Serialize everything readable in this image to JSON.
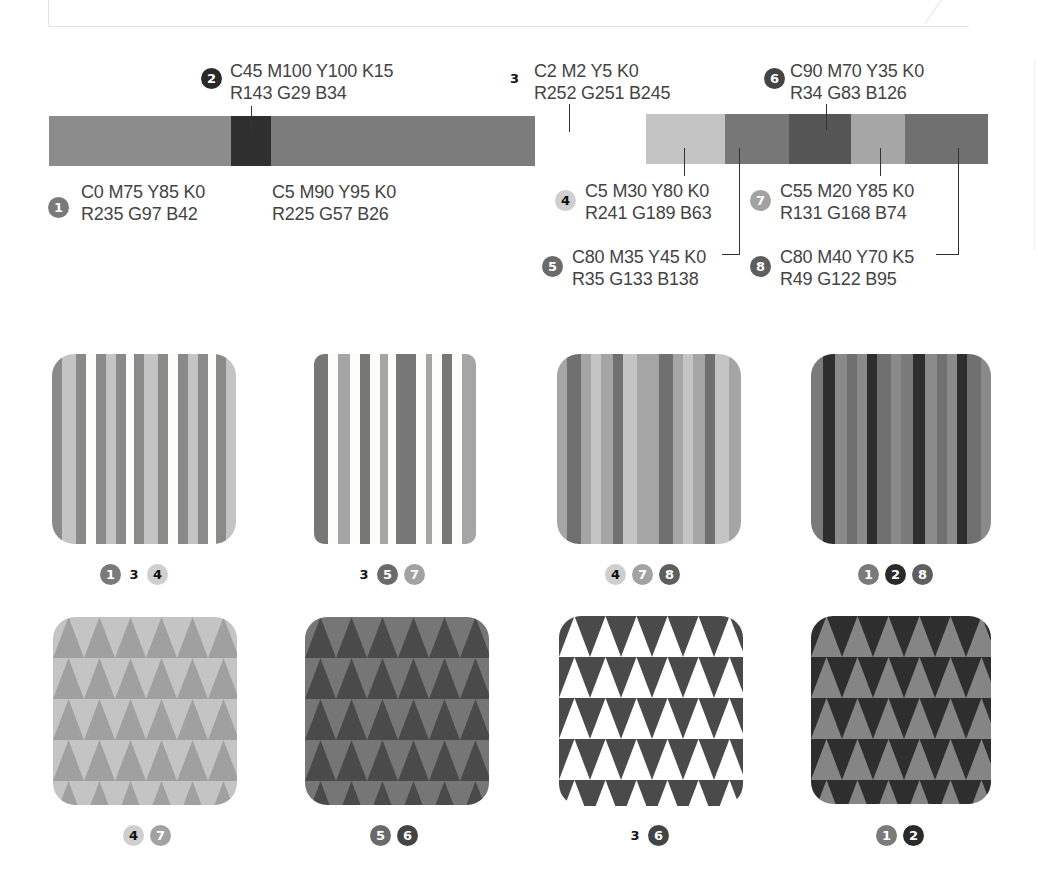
{
  "colors": [
    {
      "id": "1",
      "cmyk": "C0 M75 Y85 K0",
      "rgb": "R235 G97 B42",
      "gray": "#8a8a8a",
      "text_dark": false
    },
    {
      "id": "2",
      "cmyk": "C45 M100 Y100 K15",
      "rgb": "R143 G29 B34",
      "gray": "#2e2e2e",
      "text_dark": false
    },
    {
      "id": "3",
      "cmyk": "C2 M2 Y5 K0",
      "rgb": "R252 G251 B245",
      "gray": "#fcfcfa",
      "text_dark": true
    },
    {
      "id": "4",
      "cmyk": "C5 M30 Y80 K0",
      "rgb": "R241 G189 B63",
      "gray": "#c4c4c4",
      "text_dark": true
    },
    {
      "id": "5",
      "cmyk": "C80 M35 Y45 K0",
      "rgb": "R35 G133 B138",
      "gray": "#767676",
      "text_dark": false
    },
    {
      "id": "6",
      "cmyk": "C90 M70 Y35 K0",
      "rgb": "R34 G83 B126",
      "gray": "#555555",
      "text_dark": false
    },
    {
      "id": "7",
      "cmyk": "C55 M20 Y85 K0",
      "rgb": "R131 G168 B74",
      "gray": "#a5a5a5",
      "text_dark": false
    },
    {
      "id": "8",
      "cmyk": "C80 M40 Y70 K5",
      "rgb": "R49 G122 B95",
      "gray": "#6f6f6f",
      "text_dark": false
    }
  ],
  "extra_color": {
    "cmyk": "C5 M90 Y95 K0",
    "rgb": "R225 G57 B26",
    "gray": "#7c7c7c"
  },
  "labels": {
    "c1": {
      "num": "1",
      "cmyk": "C0 M75 Y85 K0",
      "rgb": "R235 G97 B42"
    },
    "c2": {
      "num": "2",
      "cmyk": "C45 M100 Y100 K15",
      "rgb": "R143 G29 B34"
    },
    "c3": {
      "num": "3",
      "cmyk": "C2 M2 Y5 K0",
      "rgb": "R252 G251 B245"
    },
    "cx": {
      "cmyk": "C5 M90 Y95 K0",
      "rgb": "R225 G57 B26"
    },
    "c4": {
      "num": "4",
      "cmyk": "C5 M30 Y80 K0",
      "rgb": "R241 G189 B63"
    },
    "c5": {
      "num": "5",
      "cmyk": "C80 M35 Y45 K0",
      "rgb": "R35 G133 B138"
    },
    "c6": {
      "num": "6",
      "cmyk": "C90 M70 Y35 K0",
      "rgb": "R34 G83 B126"
    },
    "c7": {
      "num": "7",
      "cmyk": "C55 M20 Y85 K0",
      "rgb": "R131 G168 B74"
    },
    "c8": {
      "num": "8",
      "cmyk": "C80 M40 Y70 K5",
      "rgb": "R49 G122 B95"
    }
  },
  "swatches": [
    {
      "name": "stripes-1-3-4",
      "pattern": "stripes",
      "legend": [
        "1",
        "3",
        "4"
      ]
    },
    {
      "name": "stripes-3-5-7",
      "pattern": "stripes",
      "legend": [
        "3",
        "5",
        "7"
      ]
    },
    {
      "name": "stripes-4-7-8",
      "pattern": "stripes",
      "legend": [
        "4",
        "7",
        "8"
      ]
    },
    {
      "name": "stripes-1-2-8",
      "pattern": "stripes",
      "legend": [
        "1",
        "2",
        "8"
      ]
    },
    {
      "name": "triangles-4-7",
      "pattern": "triangles",
      "legend": [
        "4",
        "7"
      ]
    },
    {
      "name": "triangles-5-6",
      "pattern": "triangles",
      "legend": [
        "5",
        "6"
      ]
    },
    {
      "name": "triangles-3-6",
      "pattern": "triangles",
      "legend": [
        "3",
        "6"
      ]
    },
    {
      "name": "triangles-1-2",
      "pattern": "triangles",
      "legend": [
        "1",
        "2"
      ]
    }
  ]
}
